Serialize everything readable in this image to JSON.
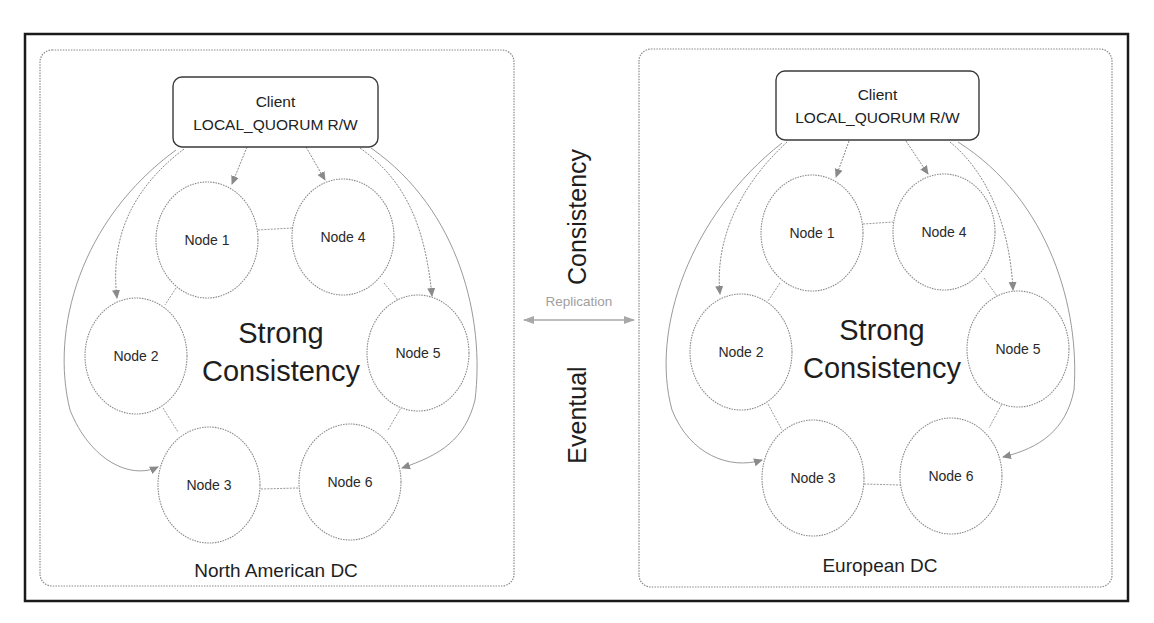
{
  "diagram": {
    "vertical_labels": {
      "top": "Consistency",
      "bottom": "Eventual"
    },
    "replication": {
      "label": "Replication",
      "direction": "bidirectional"
    },
    "datacenters": [
      {
        "id": "north-american-dc",
        "label": "North American DC",
        "client": {
          "title": "Client",
          "subtitle": "LOCAL_QUORUM R/W"
        },
        "center_label": {
          "line1": "Strong",
          "line2": "Consistency"
        },
        "nodes": [
          {
            "label": "Node 1"
          },
          {
            "label": "Node 2"
          },
          {
            "label": "Node 3"
          },
          {
            "label": "Node 4"
          },
          {
            "label": "Node 5"
          },
          {
            "label": "Node 6"
          }
        ]
      },
      {
        "id": "european-dc",
        "label": "European DC",
        "client": {
          "title": "Client",
          "subtitle": "LOCAL_QUORUM R/W"
        },
        "center_label": {
          "line1": "Strong",
          "line2": "Consistency"
        },
        "nodes": [
          {
            "label": "Node 1"
          },
          {
            "label": "Node 2"
          },
          {
            "label": "Node 3"
          },
          {
            "label": "Node 4"
          },
          {
            "label": "Node 5"
          },
          {
            "label": "Node 6"
          }
        ]
      }
    ],
    "colors": {
      "frame": "#1a1a1a",
      "panel_border": "#8a8a8a",
      "node_border": "#8c8c8c",
      "arrow": "#8a8a8a",
      "replication": "#a8a8a8",
      "text": "#1e1e1e"
    }
  }
}
